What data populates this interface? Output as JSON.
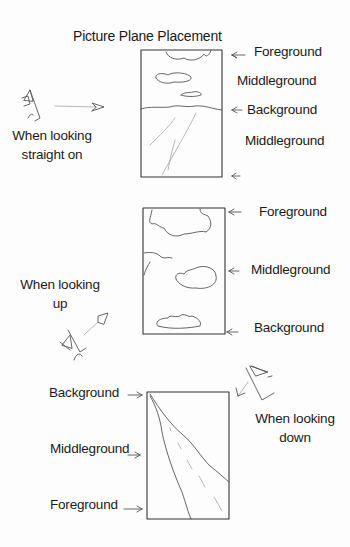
{
  "title": "Picture Plane Placement",
  "panels": [
    {
      "id": "straight-on",
      "caption": [
        "When looking",
        "straight on"
      ],
      "labels": [
        "Foreground",
        "Middleground",
        "Background",
        "Middleground"
      ]
    },
    {
      "id": "looking-up",
      "caption": [
        "When looking",
        "up"
      ],
      "labels": [
        "Foreground",
        "Middleground",
        "Background"
      ]
    },
    {
      "id": "looking-down",
      "caption": [
        "When looking",
        "down"
      ],
      "labels": [
        "Background",
        "Middleground",
        "Foreground"
      ]
    }
  ],
  "icons": {
    "eye": "eye-sketch-icon",
    "arrow": "arrow-pointer-icon"
  }
}
